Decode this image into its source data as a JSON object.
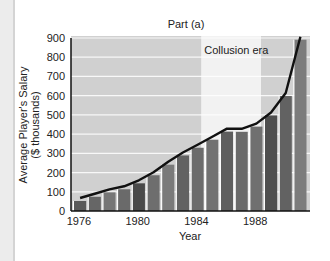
{
  "chart_data": {
    "type": "bar",
    "title": "Part (a)",
    "xlabel": "Year",
    "ylabel": "Average Player's Salary ($ thousands)",
    "ylabel_lines": [
      "Average Player's Salary",
      "($ thousands)"
    ],
    "categories": [
      "1976",
      "1977",
      "1978",
      "1979",
      "1980",
      "1981",
      "1982",
      "1983",
      "1984",
      "1985",
      "1986",
      "1987",
      "1988",
      "1989",
      "1990",
      "1991"
    ],
    "values": [
      52,
      74,
      97,
      113,
      144,
      186,
      241,
      289,
      329,
      371,
      413,
      412,
      439,
      497,
      598,
      891
    ],
    "overlay_line": "trend line connecting bar tops",
    "ylim": [
      0,
      900
    ],
    "yticks": [
      0,
      100,
      200,
      300,
      400,
      500,
      600,
      700,
      800,
      900
    ],
    "xticks": [
      "1976",
      "1980",
      "1984",
      "1988"
    ],
    "grid": true,
    "annotations": [
      {
        "text": "Collusion era",
        "span": [
          "1985",
          "1988"
        ],
        "style": "highlighted band"
      }
    ],
    "colors": {
      "background_band": "#d0d0d0",
      "collusion_band": "#f2f2f2",
      "bar": "#5c5c5c",
      "line": "#111111"
    }
  }
}
